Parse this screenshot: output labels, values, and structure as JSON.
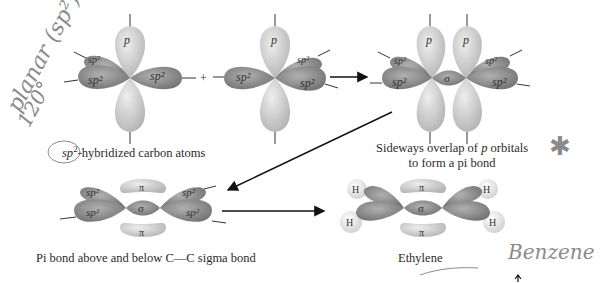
{
  "diagram": {
    "colors": {
      "p_orbital": "#cfcfcf",
      "sp2_orbital": "#8e8e8e",
      "sigma": "#9a9a9a",
      "hydrogen": "#eeeeee",
      "arrow": "#111111",
      "text": "#2a2a2a",
      "handwriting": "#8a8a8a"
    },
    "labels": {
      "p": "p",
      "sp2": "sp²",
      "sigma": "σ",
      "pi": "π",
      "h": "H",
      "plus": "+"
    },
    "captions": {
      "step1_prefix": "sp",
      "step1_sup": "2",
      "step1_rest": "-hybridized carbon atoms",
      "step2_line1_a": "Sideways overlap of ",
      "step2_line1_p": "p",
      "step2_line1_b": " orbitals",
      "step2_line2": "to form a pi bond",
      "step3": "Pi bond above and below C—C sigma bond",
      "step4": "Ethylene"
    },
    "annotations": {
      "planar": "planar (sp²)",
      "angle": "120°",
      "benzene": "Benzene",
      "star": "✱"
    }
  }
}
